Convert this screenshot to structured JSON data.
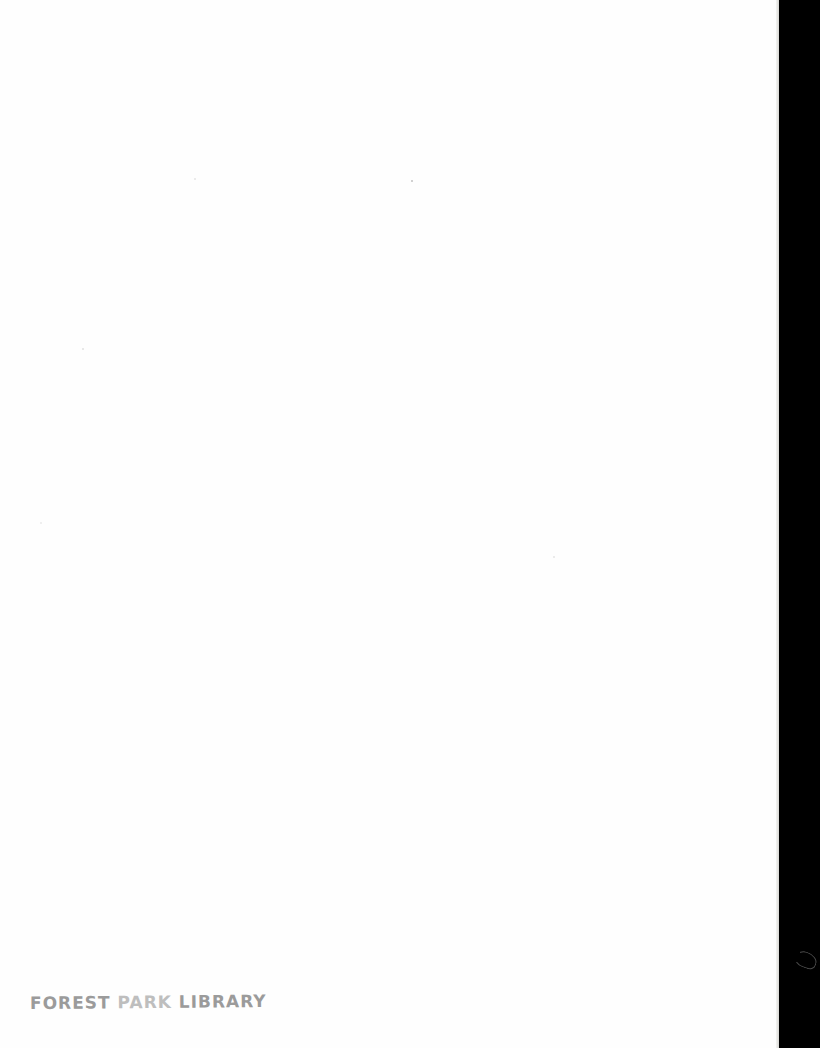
{
  "document": {
    "type": "scanned-blank-page",
    "stamp": {
      "part1": "FOREST ",
      "part2": "PARK",
      "part3": " LIBRARY"
    }
  },
  "colors": {
    "page": "#fefefe",
    "background": "#000000",
    "stamp_ink": "#8a8a8a"
  }
}
